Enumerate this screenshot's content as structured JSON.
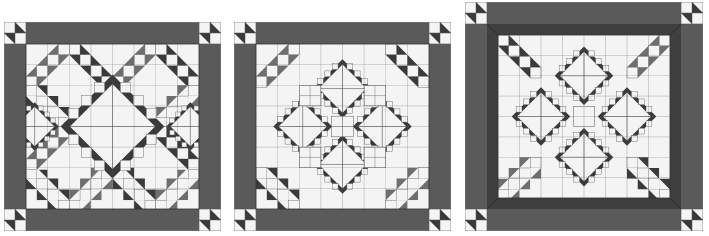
{
  "colors": {
    "background": "#ffffff",
    "border": "#5a5a5a",
    "inner_border": "#3f3f3f",
    "dark": "#3a3a3a",
    "medium": "#6e6e6e",
    "light": "#f4f4f4",
    "grid": "#555555"
  },
  "quilts": [
    {
      "id": "quilt-1",
      "layout": "center-diamond",
      "x": 4,
      "y": 22,
      "w": 217,
      "h": 209,
      "border": 22,
      "inner_border": 0,
      "grid": 8
    },
    {
      "id": "quilt-2",
      "layout": "four-diamonds-x",
      "x": 234,
      "y": 22,
      "w": 217,
      "h": 209,
      "border": 22,
      "inner_border": 0,
      "grid": 8
    },
    {
      "id": "quilt-3",
      "layout": "four-diamonds-corners",
      "x": 465,
      "y": 2,
      "w": 238,
      "h": 229,
      "border": 22,
      "inner_border": 11,
      "grid": 8
    }
  ]
}
